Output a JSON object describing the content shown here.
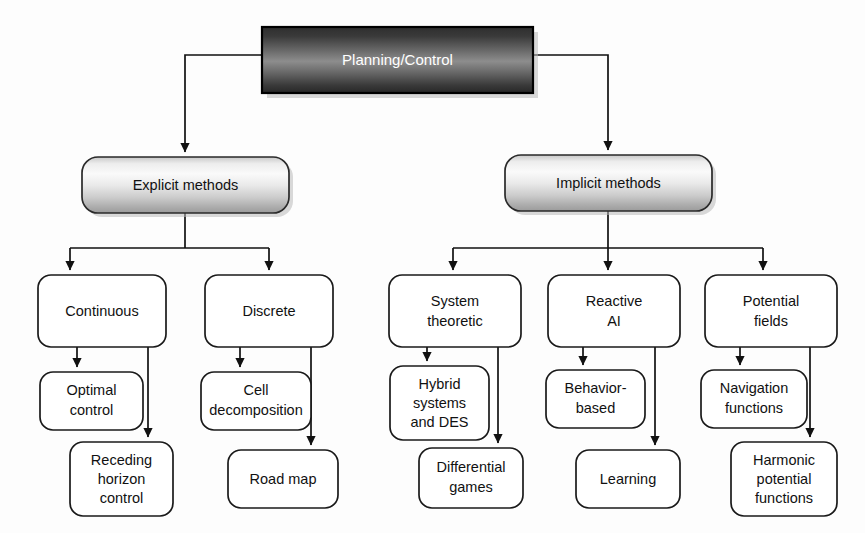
{
  "diagram": {
    "title": "Planning/Control",
    "type": "tree-taxonomy",
    "orientation": "top-down",
    "levels": 4,
    "root": {
      "id": "root",
      "label": "Planning/Control",
      "style": "dark-gradient-rectangle",
      "text_color": "#ffffff",
      "x": 262,
      "y": 27,
      "width": 271,
      "height": 66,
      "rx": 0
    },
    "level2": [
      {
        "id": "explicit",
        "label": "Explicit methods",
        "style": "light-gradient-rounded",
        "text_color": "#111111",
        "x": 82,
        "y": 157,
        "width": 207,
        "height": 56,
        "rx": 16
      },
      {
        "id": "implicit",
        "label": "Implicit methods",
        "style": "light-gradient-rounded",
        "text_color": "#111111",
        "x": 505,
        "y": 155,
        "width": 207,
        "height": 56,
        "rx": 16
      }
    ],
    "level3": [
      {
        "id": "continuous",
        "label": "Continuous",
        "lines": [
          "Continuous"
        ],
        "parent": "explicit",
        "x": 38,
        "y": 275,
        "width": 128,
        "height": 72,
        "rx": 13
      },
      {
        "id": "discrete",
        "label": "Discrete",
        "lines": [
          "Discrete"
        ],
        "parent": "explicit",
        "x": 205,
        "y": 275,
        "width": 128,
        "height": 72,
        "rx": 13
      },
      {
        "id": "system-theoretic",
        "label": "System theoretic",
        "lines": [
          "System",
          "theoretic"
        ],
        "parent": "implicit",
        "x": 389,
        "y": 275,
        "width": 132,
        "height": 72,
        "rx": 13
      },
      {
        "id": "reactive-ai",
        "label": "Reactive AI",
        "lines": [
          "Reactive",
          "AI"
        ],
        "parent": "implicit",
        "x": 548,
        "y": 275,
        "width": 132,
        "height": 72,
        "rx": 13
      },
      {
        "id": "potential-fields",
        "label": "Potential fields",
        "lines": [
          "Potential",
          "fields"
        ],
        "parent": "implicit",
        "x": 705,
        "y": 275,
        "width": 132,
        "height": 72,
        "rx": 13
      }
    ],
    "level4": [
      {
        "id": "optimal-control",
        "label": "Optimal control",
        "lines": [
          "Optimal",
          "control"
        ],
        "parent": "continuous",
        "x": 40,
        "y": 372,
        "width": 103,
        "height": 58,
        "rx": 13
      },
      {
        "id": "receding-horizon-control",
        "label": "Receding horizon control",
        "lines": [
          "Receding",
          "horizon",
          "control"
        ],
        "parent": "continuous",
        "x": 70,
        "y": 442,
        "width": 103,
        "height": 74,
        "rx": 13
      },
      {
        "id": "cell-decomposition",
        "label": "Cell decomposition",
        "lines": [
          "Cell",
          "decomposition"
        ],
        "parent": "discrete",
        "x": 201,
        "y": 372,
        "width": 110,
        "height": 58,
        "rx": 13
      },
      {
        "id": "road-map",
        "label": "Road map",
        "lines": [
          "Road map"
        ],
        "parent": "discrete",
        "x": 228,
        "y": 450,
        "width": 110,
        "height": 58,
        "rx": 13
      },
      {
        "id": "hybrid-systems-and-des",
        "label": "Hybrid systems and DES",
        "lines": [
          "Hybrid",
          "systems",
          "and DES"
        ],
        "parent": "system-theoretic",
        "x": 390,
        "y": 366,
        "width": 99,
        "height": 74,
        "rx": 13
      },
      {
        "id": "differential-games",
        "label": "Differential games",
        "lines": [
          "Differential",
          "games"
        ],
        "parent": "system-theoretic",
        "x": 419,
        "y": 448,
        "width": 104,
        "height": 60,
        "rx": 13
      },
      {
        "id": "behavior-based",
        "label": "Behavior-based",
        "lines": [
          "Behavior-",
          "based"
        ],
        "parent": "reactive-ai",
        "x": 546,
        "y": 370,
        "width": 99,
        "height": 58,
        "rx": 13
      },
      {
        "id": "learning",
        "label": "Learning",
        "lines": [
          "Learning"
        ],
        "parent": "reactive-ai",
        "x": 576,
        "y": 450,
        "width": 104,
        "height": 58,
        "rx": 13
      },
      {
        "id": "navigation-functions",
        "label": "Navigation functions",
        "lines": [
          "Navigation",
          "functions"
        ],
        "parent": "potential-fields",
        "x": 701,
        "y": 370,
        "width": 106,
        "height": 58,
        "rx": 13
      },
      {
        "id": "harmonic-potential-functions",
        "label": "Harmonic potential functions",
        "lines": [
          "Harmonic",
          "potential",
          "functions"
        ],
        "parent": "potential-fields",
        "x": 731,
        "y": 442,
        "width": 106,
        "height": 74,
        "rx": 13
      }
    ],
    "colors": {
      "root_gradient_dark": "#3b3b3b",
      "root_gradient_mid": "#8f8f8f",
      "root_gradient_edge": "#2b2b2b",
      "level2_gradient_light": "#f2f2f2",
      "level2_gradient_mid": "#d0d0d0",
      "level2_gradient_dark": "#9a9a9a",
      "box_fill": "#ffffff",
      "stroke": "#111111",
      "text": "#111111",
      "root_text": "#ffffff",
      "background": "#fdfdfd"
    }
  }
}
